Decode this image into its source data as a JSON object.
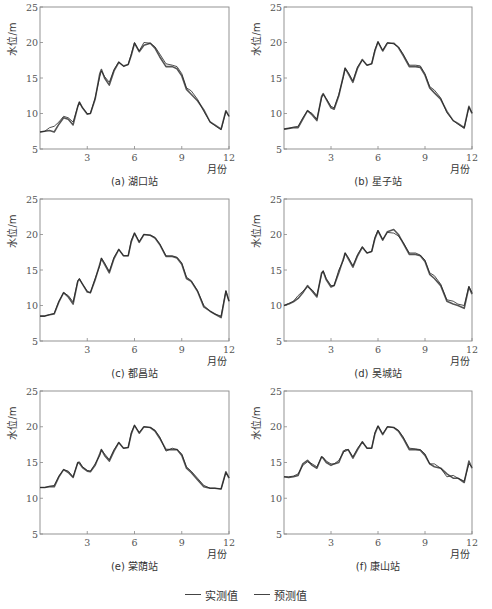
{
  "figure": {
    "legend": [
      {
        "label": "实测值",
        "color": "#555555",
        "width": 1.6
      },
      {
        "label": "预测值",
        "color": "#222222",
        "width": 0.8
      }
    ]
  },
  "chart_data": [
    {
      "type": "line",
      "caption": "(a) 湖口站",
      "xlabel": "月份",
      "ylabel": "水位/m",
      "xlim": [
        0,
        12
      ],
      "ylim": [
        5,
        25
      ],
      "xticks": [
        3,
        6,
        9,
        12
      ],
      "yticks": [
        5,
        10,
        15,
        20,
        25
      ],
      "grid": false,
      "x": [
        0,
        0.3,
        0.6,
        0.9,
        1.2,
        1.5,
        1.8,
        2.1,
        2.4,
        2.5,
        2.7,
        3.0,
        3.2,
        3.5,
        3.8,
        3.9,
        4.1,
        4.4,
        4.7,
        5.0,
        5.3,
        5.6,
        5.8,
        6.0,
        6.3,
        6.6,
        7.0,
        7.3,
        7.6,
        8.0,
        8.4,
        8.7,
        9.0,
        9.3,
        9.6,
        10.0,
        10.4,
        10.8,
        11.1,
        11.5,
        11.8,
        12.0
      ],
      "series": [
        {
          "name": "实测值",
          "values": [
            7.4,
            7.5,
            7.6,
            7.4,
            8.5,
            9.4,
            9.2,
            8.4,
            11.0,
            11.6,
            10.8,
            9.9,
            10.0,
            12.0,
            15.6,
            16.2,
            15.0,
            14.0,
            16.0,
            17.2,
            16.7,
            16.9,
            18.2,
            19.9,
            18.7,
            19.6,
            19.9,
            19.2,
            18.0,
            16.6,
            16.6,
            16.3,
            15.3,
            13.4,
            12.7,
            11.8,
            10.5,
            8.8,
            8.4,
            7.8,
            10.4,
            9.6
          ]
        },
        {
          "name": "预测值",
          "values": [
            7.4,
            7.5,
            8.0,
            8.2,
            8.8,
            9.6,
            9.4,
            8.8,
            11.0,
            11.6,
            10.8,
            10.0,
            10.0,
            12.2,
            15.2,
            16.0,
            15.2,
            14.4,
            16.2,
            17.3,
            16.6,
            16.9,
            18.4,
            20.0,
            18.8,
            20.0,
            19.9,
            19.4,
            18.4,
            17.0,
            16.8,
            16.6,
            15.6,
            13.6,
            13.2,
            12.0,
            10.3,
            8.8,
            8.3,
            7.7,
            10.3,
            9.6
          ]
        }
      ]
    },
    {
      "type": "line",
      "caption": "(b) 星子站",
      "xlabel": "月份",
      "ylabel": "水位/m",
      "xlim": [
        0,
        12
      ],
      "ylim": [
        5,
        25
      ],
      "xticks": [
        3,
        6,
        9,
        12
      ],
      "yticks": [
        5,
        10,
        15,
        20,
        25
      ],
      "grid": false,
      "x": [
        0,
        0.3,
        0.6,
        0.9,
        1.2,
        1.5,
        1.8,
        2.1,
        2.4,
        2.5,
        2.7,
        3.0,
        3.2,
        3.5,
        3.8,
        3.9,
        4.1,
        4.4,
        4.7,
        5.0,
        5.3,
        5.6,
        5.8,
        6.0,
        6.3,
        6.6,
        7.0,
        7.3,
        7.6,
        8.0,
        8.4,
        8.7,
        9.0,
        9.3,
        9.6,
        10.0,
        10.4,
        10.8,
        11.1,
        11.5,
        11.8,
        12.0
      ],
      "series": [
        {
          "name": "实测值",
          "values": [
            7.8,
            7.9,
            8.0,
            8.0,
            9.2,
            10.4,
            9.8,
            9.0,
            12.4,
            12.8,
            12.0,
            10.8,
            10.6,
            12.5,
            15.4,
            16.4,
            15.6,
            14.4,
            16.4,
            17.6,
            16.8,
            17.0,
            18.8,
            20.1,
            18.8,
            19.9,
            19.9,
            19.3,
            18.2,
            16.6,
            16.6,
            16.5,
            15.4,
            13.6,
            12.9,
            12.0,
            10.3,
            9.0,
            8.6,
            8.0,
            11.0,
            10.0
          ]
        },
        {
          "name": "预测值",
          "values": [
            7.8,
            7.9,
            8.1,
            8.2,
            9.4,
            10.4,
            10.0,
            9.2,
            12.2,
            12.7,
            12.1,
            11.0,
            10.8,
            12.7,
            15.2,
            16.4,
            15.8,
            14.6,
            16.6,
            17.5,
            16.8,
            17.0,
            19.0,
            20.1,
            18.9,
            20.0,
            19.8,
            19.4,
            18.4,
            16.8,
            16.8,
            16.7,
            15.6,
            13.8,
            13.3,
            12.2,
            10.1,
            9.0,
            8.5,
            7.9,
            10.9,
            10.1
          ]
        }
      ]
    },
    {
      "type": "line",
      "caption": "(c) 都昌站",
      "xlabel": "月份",
      "ylabel": "水位/m",
      "xlim": [
        0,
        12
      ],
      "ylim": [
        5,
        25
      ],
      "xticks": [
        3,
        6,
        9,
        12
      ],
      "yticks": [
        5,
        10,
        15,
        20,
        25
      ],
      "grid": false,
      "x": [
        0,
        0.3,
        0.6,
        0.9,
        1.2,
        1.5,
        1.8,
        2.1,
        2.4,
        2.5,
        2.7,
        3.0,
        3.2,
        3.5,
        3.8,
        3.9,
        4.1,
        4.4,
        4.7,
        5.0,
        5.3,
        5.6,
        5.8,
        6.0,
        6.3,
        6.6,
        7.0,
        7.3,
        7.6,
        8.0,
        8.4,
        8.7,
        9.0,
        9.3,
        9.6,
        10.0,
        10.4,
        10.8,
        11.1,
        11.5,
        11.8,
        12.0
      ],
      "series": [
        {
          "name": "实测值",
          "values": [
            8.5,
            8.5,
            8.7,
            8.8,
            10.5,
            11.8,
            11.2,
            10.2,
            13.4,
            13.7,
            13.0,
            11.9,
            11.8,
            13.6,
            15.8,
            16.6,
            15.8,
            14.6,
            16.6,
            17.9,
            17.0,
            17.0,
            19.0,
            20.2,
            18.9,
            20.0,
            19.9,
            19.5,
            18.6,
            16.9,
            16.9,
            16.7,
            15.8,
            13.8,
            13.4,
            12.0,
            9.8,
            9.2,
            8.8,
            8.3,
            12.0,
            10.6
          ]
        },
        {
          "name": "预测值",
          "values": [
            8.5,
            8.5,
            8.7,
            8.9,
            10.6,
            11.8,
            11.4,
            10.5,
            13.5,
            13.8,
            13.0,
            12.0,
            11.8,
            13.8,
            15.6,
            16.7,
            16.0,
            14.8,
            16.8,
            17.9,
            17.0,
            17.0,
            19.2,
            20.2,
            19.0,
            20.0,
            19.9,
            19.6,
            18.7,
            17.0,
            17.0,
            16.8,
            16.0,
            14.0,
            13.5,
            12.1,
            10.0,
            9.2,
            8.8,
            8.5,
            12.1,
            10.6
          ]
        }
      ]
    },
    {
      "type": "line",
      "caption": "(d) 吴城站",
      "xlabel": "月份",
      "ylabel": "水位/m",
      "xlim": [
        0,
        12
      ],
      "ylim": [
        5,
        25
      ],
      "xticks": [
        3,
        6,
        9,
        12
      ],
      "yticks": [
        5,
        10,
        15,
        20,
        25
      ],
      "grid": false,
      "x": [
        0,
        0.3,
        0.6,
        0.9,
        1.2,
        1.5,
        1.8,
        2.1,
        2.4,
        2.5,
        2.7,
        3.0,
        3.2,
        3.5,
        3.8,
        3.9,
        4.1,
        4.4,
        4.7,
        5.0,
        5.3,
        5.6,
        5.8,
        6.0,
        6.3,
        6.6,
        7.0,
        7.3,
        7.6,
        8.0,
        8.4,
        8.7,
        9.0,
        9.3,
        9.6,
        10.0,
        10.4,
        10.8,
        11.1,
        11.5,
        11.8,
        12.0
      ],
      "series": [
        {
          "name": "实测值",
          "values": [
            10.0,
            10.2,
            10.5,
            11.0,
            11.8,
            12.8,
            12.0,
            11.2,
            14.6,
            14.8,
            13.6,
            12.6,
            12.8,
            14.6,
            16.6,
            17.4,
            16.6,
            15.4,
            17.0,
            18.2,
            17.4,
            17.6,
            19.4,
            20.5,
            19.2,
            20.4,
            20.7,
            20.0,
            18.8,
            17.2,
            17.2,
            17.0,
            16.2,
            14.4,
            13.8,
            12.8,
            10.6,
            10.2,
            10.0,
            9.6,
            12.6,
            11.6
          ]
        },
        {
          "name": "预测值",
          "values": [
            10.0,
            10.3,
            10.6,
            11.4,
            12.0,
            12.6,
            12.2,
            11.4,
            14.4,
            14.9,
            13.8,
            12.8,
            12.8,
            15.0,
            16.4,
            17.4,
            16.8,
            15.6,
            17.2,
            18.3,
            17.4,
            17.6,
            19.6,
            20.6,
            19.3,
            20.3,
            20.2,
            19.8,
            18.9,
            17.4,
            17.4,
            17.1,
            16.4,
            14.6,
            14.2,
            13.0,
            10.8,
            10.6,
            10.2,
            10.0,
            12.7,
            11.8
          ]
        }
      ]
    },
    {
      "type": "line",
      "caption": "(e) 棠荫站",
      "xlabel": "月份",
      "ylabel": "水位/m",
      "xlim": [
        0,
        12
      ],
      "ylim": [
        5,
        25
      ],
      "xticks": [
        3,
        6,
        9,
        12
      ],
      "yticks": [
        5,
        10,
        15,
        20,
        25
      ],
      "grid": false,
      "x": [
        0,
        0.3,
        0.6,
        0.9,
        1.2,
        1.5,
        1.8,
        2.1,
        2.4,
        2.5,
        2.7,
        3.0,
        3.2,
        3.5,
        3.8,
        3.9,
        4.1,
        4.4,
        4.7,
        5.0,
        5.3,
        5.6,
        5.8,
        6.0,
        6.3,
        6.6,
        7.0,
        7.3,
        7.6,
        8.0,
        8.4,
        8.7,
        9.0,
        9.3,
        9.6,
        10.0,
        10.4,
        10.8,
        11.1,
        11.5,
        11.8,
        12.0
      ],
      "series": [
        {
          "name": "实测值",
          "values": [
            11.5,
            11.5,
            11.6,
            11.6,
            13.0,
            14.0,
            13.6,
            12.9,
            15.0,
            14.9,
            14.3,
            13.8,
            13.7,
            14.6,
            16.2,
            16.8,
            16.0,
            15.2,
            16.6,
            17.8,
            17.0,
            17.1,
            19.0,
            20.2,
            19.1,
            20.0,
            19.9,
            19.4,
            18.4,
            16.8,
            16.8,
            16.8,
            16.0,
            14.2,
            13.6,
            12.6,
            11.6,
            11.4,
            11.4,
            11.3,
            13.7,
            12.8
          ]
        },
        {
          "name": "预测值",
          "values": [
            11.5,
            11.5,
            11.7,
            11.8,
            13.1,
            14.0,
            13.8,
            13.0,
            15.0,
            15.1,
            14.4,
            13.9,
            13.8,
            14.8,
            16.0,
            16.8,
            16.2,
            15.4,
            16.8,
            17.8,
            17.0,
            17.1,
            19.2,
            20.2,
            19.2,
            20.0,
            19.9,
            19.5,
            18.6,
            16.6,
            17.0,
            16.8,
            16.2,
            14.4,
            13.8,
            12.8,
            11.8,
            11.4,
            11.4,
            11.3,
            13.6,
            12.9
          ]
        }
      ]
    },
    {
      "type": "line",
      "caption": "(f) 康山站",
      "xlabel": "月份",
      "ylabel": "水位/m",
      "xlim": [
        0,
        12
      ],
      "ylim": [
        5,
        25
      ],
      "xticks": [
        3,
        6,
        9,
        12
      ],
      "yticks": [
        5,
        10,
        15,
        20,
        25
      ],
      "grid": false,
      "x": [
        0,
        0.3,
        0.6,
        0.9,
        1.2,
        1.5,
        1.8,
        2.1,
        2.4,
        2.5,
        2.7,
        3.0,
        3.2,
        3.5,
        3.8,
        3.9,
        4.1,
        4.4,
        4.7,
        5.0,
        5.3,
        5.6,
        5.8,
        6.0,
        6.3,
        6.6,
        7.0,
        7.3,
        7.6,
        8.0,
        8.4,
        8.7,
        9.0,
        9.3,
        9.6,
        10.0,
        10.4,
        10.8,
        11.1,
        11.5,
        11.8,
        12.0
      ],
      "series": [
        {
          "name": "实测值",
          "values": [
            13.0,
            12.9,
            13.0,
            13.2,
            14.8,
            15.3,
            14.6,
            14.2,
            15.8,
            15.6,
            15.0,
            14.6,
            14.8,
            15.0,
            16.6,
            16.6,
            16.8,
            15.6,
            16.8,
            17.9,
            17.0,
            17.0,
            19.0,
            20.1,
            18.9,
            20.0,
            19.9,
            19.4,
            18.4,
            16.8,
            16.8,
            16.7,
            16.0,
            14.8,
            14.4,
            14.2,
            13.4,
            12.8,
            12.8,
            12.2,
            15.2,
            14.2
          ]
        },
        {
          "name": "预测值",
          "values": [
            13.0,
            13.0,
            13.1,
            13.4,
            14.6,
            15.1,
            14.8,
            14.4,
            15.8,
            15.7,
            15.2,
            14.8,
            14.8,
            15.3,
            16.4,
            16.8,
            16.8,
            15.8,
            17.0,
            17.9,
            17.0,
            17.0,
            19.2,
            20.1,
            19.0,
            20.0,
            19.9,
            19.5,
            18.6,
            17.0,
            16.9,
            16.8,
            16.2,
            14.8,
            14.8,
            14.2,
            13.0,
            13.2,
            12.8,
            12.4,
            14.8,
            14.4
          ]
        }
      ]
    }
  ]
}
